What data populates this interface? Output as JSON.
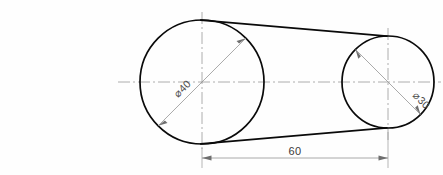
{
  "drawing": {
    "title": "Two-pulley belt drive outline",
    "background_color": "#fefefe",
    "line_color": "#0a0a0a",
    "dimension_color": "#8d8d8d",
    "centerline_color": "#9a9a9a",
    "units": "mm"
  },
  "geometry": {
    "left_circle": {
      "name": "large-pulley",
      "center_x": 202,
      "center_y": 82,
      "radius": 62,
      "diameter_label": "⌀40"
    },
    "right_circle": {
      "name": "small-pulley",
      "center_x": 388,
      "center_y": 82,
      "radius": 46,
      "diameter_label": "⌀30"
    }
  },
  "dimensions": {
    "center_distance": {
      "label": "60",
      "from_x": 202,
      "to_x": 388,
      "line_y": 158
    },
    "large_diameter": {
      "label": "⌀40",
      "value": 40,
      "text_x": 178,
      "text_y": 98,
      "rotation": -45
    },
    "small_diameter": {
      "label": "⌀30",
      "value": 30,
      "text_x": 412,
      "text_y": 96,
      "rotation": 45
    }
  }
}
